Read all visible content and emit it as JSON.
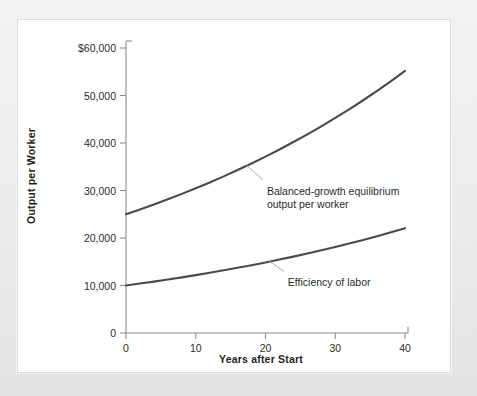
{
  "figure": {
    "background_color": "#ebebeb",
    "panel_color": "#ffffff",
    "panel_border_color": "#dcdcdc"
  },
  "chart_data": {
    "type": "line",
    "title": "",
    "xlabel": "Years after Start",
    "ylabel": "Output per Worker",
    "xlim": [
      0,
      40
    ],
    "ylim": [
      0,
      60000
    ],
    "grid": false,
    "legend_position": "inline-annotations",
    "x_tick_labels": [
      "0",
      "10",
      "20",
      "30",
      "40"
    ],
    "x_ticks": [
      0,
      10,
      20,
      30,
      40
    ],
    "y_tick_labels": [
      "0",
      "10,000",
      "20,000",
      "30,000",
      "40,000",
      "50,000",
      "$60,000"
    ],
    "y_ticks": [
      0,
      10000,
      20000,
      30000,
      40000,
      50000,
      60000
    ],
    "x": [
      0,
      2,
      4,
      6,
      8,
      10,
      12,
      14,
      16,
      18,
      20,
      22,
      24,
      26,
      28,
      30,
      32,
      34,
      36,
      38,
      40
    ],
    "series": [
      {
        "name": "Balanced-growth equilibrium output per worker",
        "color": "#4a4a4a",
        "line_width": 2.1,
        "values": [
          25000,
          26010,
          27060,
          28153,
          29290,
          30472,
          31702,
          32982,
          34314,
          35699,
          37141,
          38641,
          40201,
          41824,
          43514,
          45271,
          47099,
          49001,
          50980,
          53038,
          55180
        ]
      },
      {
        "name": "Efficiency of labor",
        "color": "#4a4a4a",
        "line_width": 2.1,
        "values": [
          10000,
          10404,
          10824,
          11261,
          11716,
          12189,
          12681,
          13193,
          13726,
          14280,
          14856,
          15457,
          16081,
          16730,
          17406,
          18109,
          18840,
          19601,
          20392,
          21215,
          22072
        ]
      }
    ],
    "annotations": [
      {
        "id": "balanced-growth-annotation",
        "text": "Balanced-growth equilibrium\noutput per worker",
        "anchor_x": 17.2,
        "anchor_y": 35400,
        "text_x": 20.2,
        "text_y": 31200
      },
      {
        "id": "efficiency-of-labor-annotation",
        "text": "Efficiency of labor",
        "anchor_x": 20.4,
        "anchor_y": 15300,
        "text_x": 23.2,
        "text_y": 11900
      }
    ]
  }
}
